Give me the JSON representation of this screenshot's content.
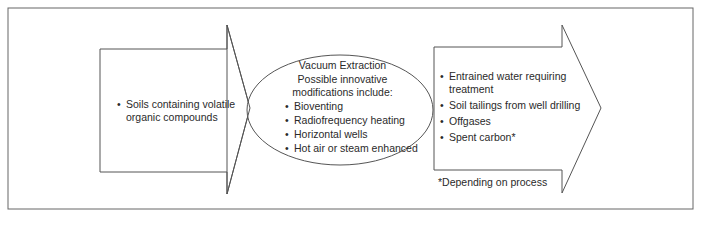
{
  "input": {
    "items": [
      "Soils containing volatile",
      "organic compounds"
    ]
  },
  "process": {
    "title": "Vacuum Extraction",
    "subtitle_line1": "Possible innovative",
    "subtitle_line2": "modifications include:",
    "items": [
      "Bioventing",
      "Radiofrequency heating",
      "Horizontal wells",
      "Hot air or steam enhanced"
    ]
  },
  "output": {
    "items": [
      {
        "line1": "Entrained water requiring",
        "line2": "treatment"
      },
      {
        "line1": "Soil tailings from well drilling"
      },
      {
        "line1": "Offgases"
      },
      {
        "line1": "Spent carbon*"
      }
    ],
    "footnote": "*Depending on process"
  },
  "colors": {
    "stroke": "#555555",
    "text": "#2a2a2a",
    "background": "#ffffff"
  }
}
